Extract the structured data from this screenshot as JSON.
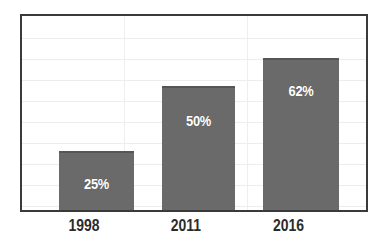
{
  "chart_data": {
    "type": "bar",
    "title": "",
    "subtitle": "",
    "xlabel": "",
    "ylabel": "",
    "categories": [
      "1998",
      "2011",
      "2016"
    ],
    "values": [
      25,
      50,
      62
    ],
    "data_labels": [
      "25%",
      "50%",
      "62%"
    ],
    "ylim": [
      0,
      80
    ],
    "grid": {
      "horizontal": true,
      "vertical": true,
      "horizontal_count": 9,
      "vertical_count": 2
    },
    "legend": {
      "visible": false,
      "position": "none",
      "entries": []
    },
    "series": [
      {
        "name": "Percentage",
        "values": [
          25,
          50,
          62
        ]
      }
    ],
    "annotations": []
  },
  "style": {
    "bar_color": "#6a6a6a",
    "bar_top_edge_color": "#565656",
    "frame_color": "#3a3a3a",
    "grid_color": "#ededed",
    "background": "#ffffff",
    "value_label_color": "#ffffff",
    "category_label_color": "#2b2b2b"
  },
  "geometry": {
    "bars": [
      {
        "left": 37,
        "width": 75,
        "height": 59,
        "label_top": 22
      },
      {
        "left": 140,
        "width": 73,
        "height": 124,
        "label_top": 24
      },
      {
        "left": 241,
        "width": 76,
        "height": 152,
        "label_top": 22
      }
    ],
    "category_label_left": [
      45,
      148,
      249
    ],
    "category_label_width": [
      78,
      76,
      79
    ],
    "hgrid_y": [
      22,
      43,
      64,
      85,
      106,
      127,
      148,
      169,
      190
    ],
    "vgrid_x": [
      102,
      225
    ]
  }
}
